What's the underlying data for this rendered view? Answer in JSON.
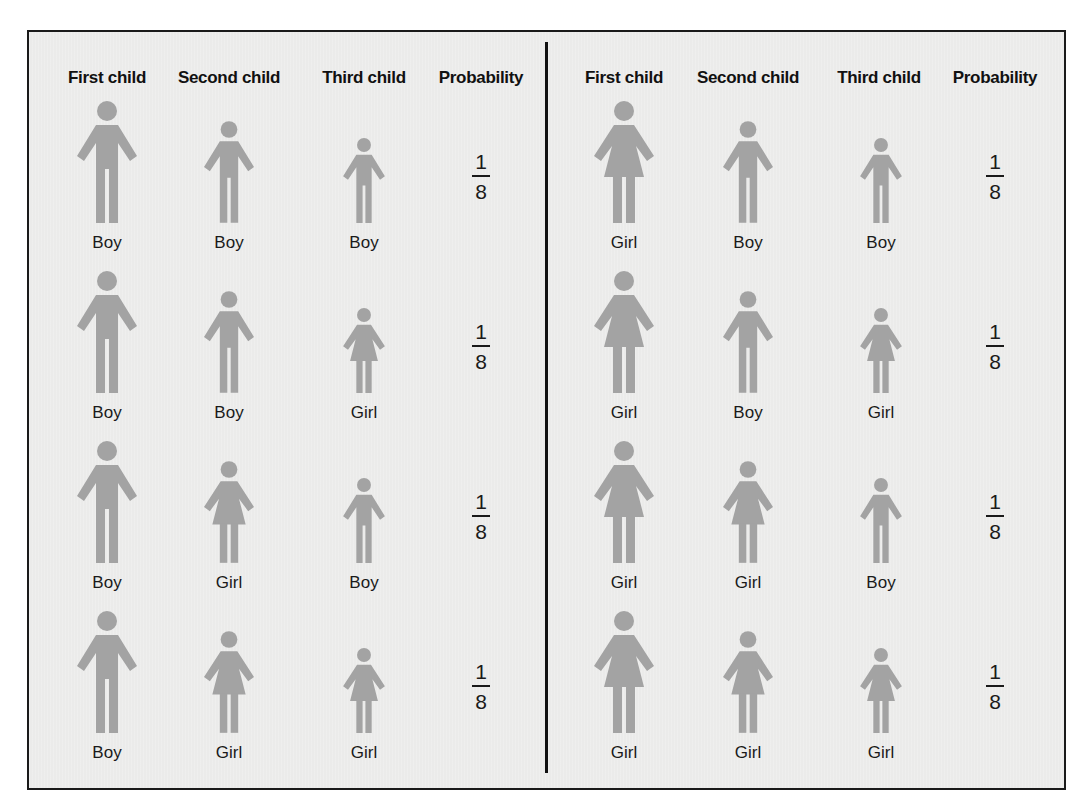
{
  "colors": {
    "figure": "#a3a3a3",
    "background": "#ebebea",
    "border": "#1a1a1a",
    "text": "#1a1a1a"
  },
  "headers": [
    "First child",
    "Second child",
    "Third child",
    "Probability"
  ],
  "panels": [
    {
      "rows": [
        {
          "children": [
            "Boy",
            "Boy",
            "Boy"
          ],
          "probability": {
            "numerator": "1",
            "denominator": "8"
          }
        },
        {
          "children": [
            "Boy",
            "Boy",
            "Girl"
          ],
          "probability": {
            "numerator": "1",
            "denominator": "8"
          }
        },
        {
          "children": [
            "Boy",
            "Girl",
            "Boy"
          ],
          "probability": {
            "numerator": "1",
            "denominator": "8"
          }
        },
        {
          "children": [
            "Boy",
            "Girl",
            "Girl"
          ],
          "probability": {
            "numerator": "1",
            "denominator": "8"
          }
        }
      ]
    },
    {
      "rows": [
        {
          "children": [
            "Girl",
            "Boy",
            "Boy"
          ],
          "probability": {
            "numerator": "1",
            "denominator": "8"
          }
        },
        {
          "children": [
            "Girl",
            "Boy",
            "Girl"
          ],
          "probability": {
            "numerator": "1",
            "denominator": "8"
          }
        },
        {
          "children": [
            "Girl",
            "Girl",
            "Boy"
          ],
          "probability": {
            "numerator": "1",
            "denominator": "8"
          }
        },
        {
          "children": [
            "Girl",
            "Girl",
            "Girl"
          ],
          "probability": {
            "numerator": "1",
            "denominator": "8"
          }
        }
      ]
    }
  ],
  "icons": {
    "Boy": "boy-figure-icon",
    "Girl": "girl-figure-icon"
  }
}
